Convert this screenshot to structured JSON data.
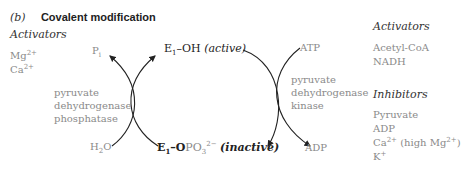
{
  "title": {
    "label": "(b)",
    "text": "Covalent modification"
  },
  "left_panel": {
    "heading": "Activators",
    "items": [
      {
        "base": "Mg",
        "sup": "2+"
      },
      {
        "base": "Ca",
        "sup": "2+"
      }
    ]
  },
  "left_enzyme": {
    "lines": [
      "pyruvate",
      "dehydrogenase",
      "phosphatase"
    ]
  },
  "right_enzyme": {
    "lines": [
      "pyruvate",
      "dehydrogenase",
      "kinase"
    ]
  },
  "cycle": {
    "top": {
      "prefix": "E",
      "sub": "1",
      "suffix": "–OH",
      "state": "(active)"
    },
    "bottom": {
      "prefix": "E",
      "sub": "1",
      "mid": "–O",
      "group": "PO",
      "group_sub": "3",
      "group_sup": "2−",
      "state": "(inactive)"
    },
    "pi": {
      "base": "P",
      "sub": "i"
    },
    "h2o": {
      "a": "H",
      "sub": "2",
      "b": "O"
    },
    "atp": "ATP",
    "adp": "ADP"
  },
  "right_panel": {
    "activators_heading": "Activators",
    "activators": [
      "Acetyl-CoA",
      "NADH"
    ],
    "inhibitors_heading": "Inhibitors",
    "inhibitors": [
      {
        "text": "Pyruvate"
      },
      {
        "text": "ADP"
      },
      {
        "base": "Ca",
        "sup": "2+",
        "rest": " (high Mg",
        "sup2": "2+",
        "end": ")"
      },
      {
        "base": "K",
        "sup": "+"
      }
    ]
  }
}
